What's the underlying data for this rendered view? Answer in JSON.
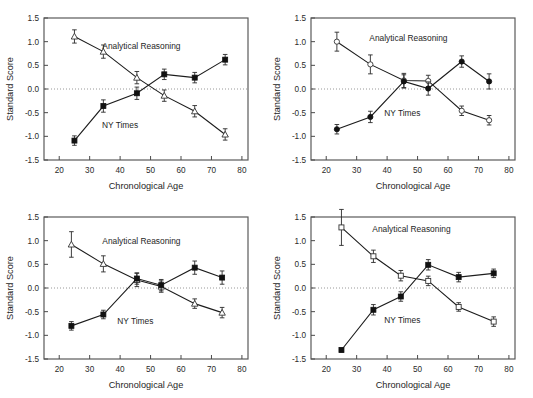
{
  "figure": {
    "width": 533,
    "height": 398,
    "background": "#ffffff",
    "panel_count": 4,
    "layout": "2x2 grid of line plots"
  },
  "axes": {
    "xlabel": "Chronological Age",
    "ylabel": "Standard Score",
    "xlim": [
      15,
      82
    ],
    "ylim": [
      -1.5,
      1.5
    ],
    "xticks": [
      20,
      30,
      40,
      50,
      60,
      70,
      80
    ],
    "xticklabels": [
      "20",
      "30",
      "40",
      "50",
      "60",
      "70",
      "80"
    ],
    "yticks": [
      -1.5,
      -1.0,
      -0.5,
      0.0,
      0.5,
      1.0,
      1.5
    ],
    "yticklabels": [
      "-1.5",
      "-1.0",
      "-0.5",
      "0.0",
      "0.5",
      "1.0",
      "1.5"
    ],
    "zeroline_value": 0.0,
    "grid": false
  },
  "series_labels": {
    "analytical": "Analytical Reasoning",
    "nytimes": "NY Times"
  },
  "colors": {
    "line": "#1c1c1c",
    "marker_filled": "#111111",
    "marker_open_fill": "#ffffff",
    "marker_open_stroke": "#333333",
    "frame": "#5a5a5a",
    "zeroline": "#8d8d8d",
    "text": "#1e1e1e"
  },
  "chart_data": [
    {
      "type": "line",
      "panel": "top-left",
      "title": "",
      "xlabel": "Chronological Age",
      "ylabel": "Standard Score",
      "xlim": [
        15,
        82
      ],
      "ylim": [
        -1.5,
        1.5
      ],
      "grid": false,
      "legend": "inline annotations",
      "annotations": [
        {
          "text": "Analytical Reasoning",
          "x": 47,
          "y": 0.84
        },
        {
          "text": "NY Times",
          "x": 40,
          "y": -0.82
        }
      ],
      "series": [
        {
          "name": "Analytical Reasoning",
          "marker": "open-triangle",
          "x": [
            25.0,
            34.5,
            45.5,
            54.5,
            64.5,
            74.5
          ],
          "values": [
            1.11,
            0.79,
            0.24,
            -0.14,
            -0.47,
            -0.96
          ],
          "error": [
            0.14,
            0.14,
            0.13,
            0.12,
            0.12,
            0.12
          ]
        },
        {
          "name": "NY Times",
          "marker": "filled-square",
          "x": [
            25.0,
            34.5,
            45.5,
            54.5,
            64.5,
            74.5
          ],
          "values": [
            -1.09,
            -0.36,
            -0.09,
            0.31,
            0.24,
            0.62
          ],
          "error": [
            0.1,
            0.13,
            0.13,
            0.11,
            0.11,
            0.11
          ]
        }
      ]
    },
    {
      "type": "line",
      "panel": "top-right",
      "title": "",
      "xlabel": "Chronological Age",
      "ylabel": "Standard Score",
      "xlim": [
        15,
        82
      ],
      "ylim": [
        -1.5,
        1.5
      ],
      "grid": false,
      "legend": "inline annotations",
      "annotations": [
        {
          "text": "Analytical Reasoning",
          "x": 47,
          "y": 1.02
        },
        {
          "text": "NY Times",
          "x": 45,
          "y": -0.56
        }
      ],
      "series": [
        {
          "name": "Analytical Reasoning",
          "marker": "open-circle",
          "x": [
            23.5,
            34.5,
            45.5,
            53.5,
            64.5,
            73.5
          ],
          "values": [
            1.0,
            0.52,
            0.18,
            0.17,
            -0.46,
            -0.66
          ],
          "error": [
            0.2,
            0.2,
            0.15,
            0.12,
            0.1,
            0.1
          ]
        },
        {
          "name": "NY Times",
          "marker": "filled-circle",
          "x": [
            23.5,
            34.5,
            45.5,
            53.5,
            64.5,
            73.5
          ],
          "values": [
            -0.85,
            -0.59,
            0.16,
            0.01,
            0.58,
            0.16
          ],
          "error": [
            0.1,
            0.12,
            0.14,
            0.14,
            0.12,
            0.16
          ]
        }
      ]
    },
    {
      "type": "line",
      "panel": "bottom-left",
      "title": "",
      "xlabel": "Chronological Age",
      "ylabel": "Standard Score",
      "xlim": [
        15,
        82
      ],
      "ylim": [
        -1.5,
        1.5
      ],
      "grid": false,
      "legend": "inline annotations",
      "annotations": [
        {
          "text": "Analytical Reasoning",
          "x": 47,
          "y": 0.92
        },
        {
          "text": "NY Times",
          "x": 45,
          "y": -0.76
        }
      ],
      "series": [
        {
          "name": "Analytical Reasoning",
          "marker": "open-triangle",
          "x": [
            24.0,
            34.5,
            45.5,
            53.5,
            64.5,
            73.5
          ],
          "values": [
            0.92,
            0.51,
            0.17,
            0.03,
            -0.33,
            -0.52
          ],
          "error": [
            0.27,
            0.17,
            0.14,
            0.12,
            0.1,
            0.11
          ]
        },
        {
          "name": "NY Times",
          "marker": "filled-square",
          "x": [
            24.0,
            34.5,
            45.5,
            53.5,
            64.5,
            73.5
          ],
          "values": [
            -0.8,
            -0.56,
            0.2,
            0.06,
            0.43,
            0.22
          ],
          "error": [
            0.09,
            0.09,
            0.12,
            0.12,
            0.14,
            0.14
          ]
        }
      ]
    },
    {
      "type": "line",
      "panel": "bottom-right",
      "title": "",
      "xlabel": "Chronological Age",
      "ylabel": "Standard Score",
      "xlim": [
        15,
        82
      ],
      "ylim": [
        -1.5,
        1.5
      ],
      "grid": false,
      "legend": "inline annotations",
      "annotations": [
        {
          "text": "Analytical Reasoning",
          "x": 48,
          "y": 1.18
        },
        {
          "text": "NY Times",
          "x": 45,
          "y": -0.74
        }
      ],
      "series": [
        {
          "name": "Analytical Reasoning",
          "marker": "open-square",
          "x": [
            25.0,
            35.5,
            44.5,
            53.5,
            63.5,
            75.0
          ],
          "values": [
            1.28,
            0.67,
            0.26,
            0.15,
            -0.4,
            -0.71
          ],
          "error": [
            0.38,
            0.13,
            0.11,
            0.1,
            0.09,
            0.1
          ]
        },
        {
          "name": "NY Times",
          "marker": "filled-square",
          "x": [
            25.0,
            35.5,
            44.5,
            53.5,
            63.5,
            75.0
          ],
          "values": [
            -1.31,
            -0.46,
            -0.18,
            0.49,
            0.23,
            0.31
          ],
          "error": [
            0.04,
            0.11,
            0.1,
            0.11,
            0.1,
            0.09
          ]
        }
      ]
    }
  ]
}
